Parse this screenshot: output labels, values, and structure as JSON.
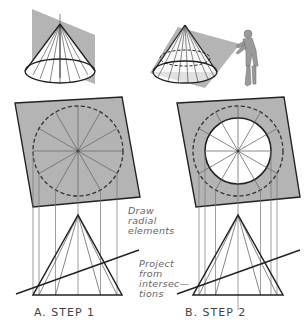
{
  "figure": {
    "top_left": {
      "description": "cone cut by vertical plane"
    },
    "top_right": {
      "description": "cone cut by inclined plane with observer figure"
    },
    "panel_a": {
      "caption": "A.  STEP  1",
      "radial_count": 12
    },
    "panel_b": {
      "caption": "B.  STEP  2",
      "radial_count": 12
    }
  },
  "annotations": {
    "draw_radial": [
      "Draw",
      "radial",
      "elements"
    ],
    "project": [
      "Project",
      "from",
      "intersec—",
      "tions"
    ]
  },
  "colors": {
    "plane_fill": "#b4b4b4",
    "line": "#2a2a2a",
    "thin_line": "#777777",
    "text": "#555555"
  }
}
